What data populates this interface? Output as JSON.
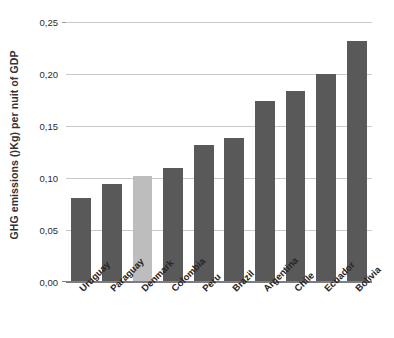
{
  "chart_data": {
    "type": "bar",
    "title": "",
    "subtitle": "",
    "xlabel": "",
    "ylabel": "GHG emissions ()Kg) per nuit of GDP",
    "categories": [
      "Uruguay",
      "Paraguay",
      "Denmark",
      "Colombia",
      "Peru",
      "Brazil",
      "Argentina",
      "Chile",
      "Ecuador",
      "Bolivia"
    ],
    "values": [
      0.081,
      0.094,
      0.102,
      0.11,
      0.132,
      0.138,
      0.174,
      0.184,
      0.2,
      0.232
    ],
    "series": [
      {
        "name": "GHG emissions per unit of GDP",
        "values": [
          0.081,
          0.094,
          0.102,
          0.11,
          0.132,
          0.138,
          0.174,
          0.184,
          0.2,
          0.232
        ]
      }
    ],
    "ylim": [
      0.0,
      0.25
    ],
    "ytick_values": [
      0.25,
      0.2,
      0.15,
      0.1,
      0.05,
      0.0
    ],
    "ytick_labels": [
      "0,25",
      "0,20",
      "0,15",
      "0,10",
      "0,05",
      "0,00"
    ],
    "grid": true,
    "grid_axis": "y",
    "legend": false,
    "legend_position": "none",
    "bar_color": "#595959",
    "highlight_color": "#bdbdbd",
    "highlight_category": "Denmark",
    "highlight_index": 2,
    "gridline_color": "#c9c9c9",
    "axis_color": "#7d7d7d",
    "background_color": "#ffffff",
    "decimal_separator": ","
  }
}
